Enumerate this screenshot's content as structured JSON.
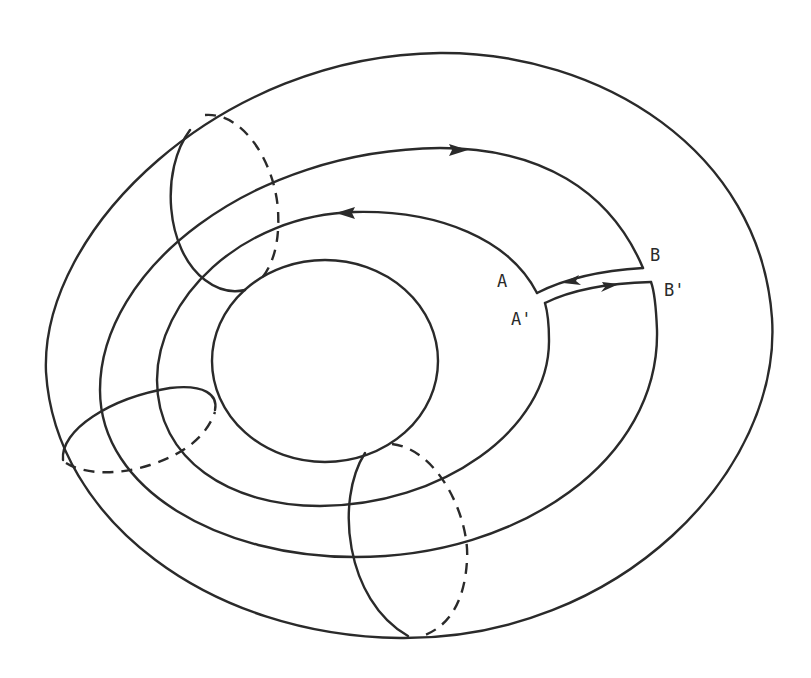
{
  "figure": {
    "stroke_color": "#2a2a2a",
    "background_color": "#ffffff",
    "labels": {
      "A": "A",
      "A_prime": "A'",
      "B": "B",
      "B_prime": "B'"
    },
    "arrows": {
      "outer_path_top": "right",
      "inner_path_top": "left",
      "cut_upper": "left",
      "cut_lower": "right"
    },
    "meridians": [
      {
        "name": "upper-left",
        "solid_side": "front",
        "dashed_side": "back"
      },
      {
        "name": "left",
        "solid_side": "top",
        "dashed_side": "bottom"
      },
      {
        "name": "bottom",
        "solid_side": "left",
        "dashed_side": "right"
      }
    ]
  }
}
